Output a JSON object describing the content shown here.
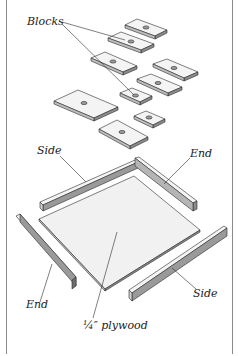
{
  "figure": {
    "labels": {
      "blocks": "Blocks",
      "side_top": "Side",
      "end_top": "End",
      "end_bottom": "End",
      "side_bottom": "Side",
      "plywood": "¼″ plywood"
    },
    "colors": {
      "line": "#2a2a2a",
      "face": "#f4f4f4",
      "edge": "#bdbdbd",
      "dark_edge": "#8c8c8c",
      "border": "#8a8a8a"
    },
    "parts": {
      "block_count": 9,
      "frame_pieces": [
        "Side",
        "End",
        "End",
        "Side"
      ],
      "base": "¼″ plywood"
    }
  }
}
